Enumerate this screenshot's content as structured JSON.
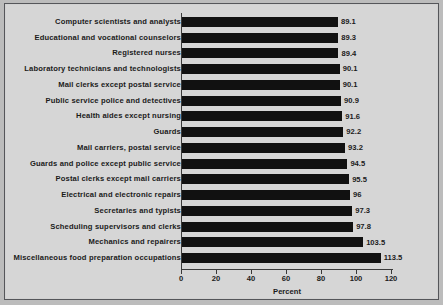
{
  "chart_data": {
    "type": "bar",
    "orientation": "horizontal",
    "title": "",
    "xlabel": "Percent",
    "ylabel": "",
    "xlim": [
      0,
      120
    ],
    "xticks": [
      0,
      20,
      40,
      60,
      80,
      100,
      120
    ],
    "grid": false,
    "legend": null,
    "bar_color": "#111111",
    "categories": [
      "Computer scientists and analysts",
      "Educational and vocational counselors",
      "Registered nurses",
      "Laboratory technicians and technologists",
      "Mail clerks except postal service",
      "Public service police and detectives",
      "Health aides except nursing",
      "Guards",
      "Mail carriers, postal service",
      "Guards and police except public service",
      "Postal clerks except mail carriers",
      "Electrical and electronic repairs",
      "Secretaries and typists",
      "Scheduling supervisors and clerks",
      "Mechanics and repairers",
      "Miscellaneous food preparation occupations"
    ],
    "values": [
      89.1,
      89.3,
      89.4,
      90.1,
      90.1,
      90.9,
      91.6,
      92.2,
      93.2,
      94.5,
      95.5,
      96,
      97.3,
      97.8,
      103.5,
      113.5
    ],
    "value_labels": [
      "89.1",
      "89.3",
      "89.4",
      "90.1",
      "90.1",
      "90.9",
      "91.6",
      "92.2",
      "93.2",
      "94.5",
      "95.5",
      "96",
      "97.3",
      "97.8",
      "103.5",
      "113.5"
    ]
  },
  "figure": {
    "background_color": "#bcbcbc",
    "panel_color": "#d6d6d6",
    "border_color": "#55565a",
    "axis_color": "#3a3a3a"
  }
}
